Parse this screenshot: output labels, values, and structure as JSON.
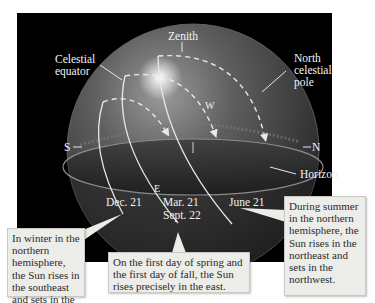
{
  "labels": {
    "zenith": "Zenith",
    "celestial_equator_line1": "Celestial",
    "celestial_equator_line2": "equator",
    "north_celestial_pole_line1": "North",
    "north_celestial_pole_line2": "celestial",
    "north_celestial_pole_line3": "pole",
    "south": "S",
    "north": "N",
    "west": "W",
    "east": "E",
    "horizon": "Horizon",
    "dec21": "Dec. 21",
    "mar21": "Mar. 21",
    "sept22": "Sept. 22",
    "june21": "June 21"
  },
  "callouts": {
    "winter": "In winter in the northern hemisphere, the Sun rises in the southeast and sets in the southwest.",
    "equinox": "On the first day of spring and the first day of fall, the Sun rises precisely in the east.",
    "summer": "During summer in the northern hemisphere, the Sun rises in the northeast and sets in the northwest."
  },
  "colors": {
    "background": "#000000",
    "sphere": "#5a5a5a",
    "path_line": "#e8e8e8",
    "callout_bg": "#ecece9"
  }
}
